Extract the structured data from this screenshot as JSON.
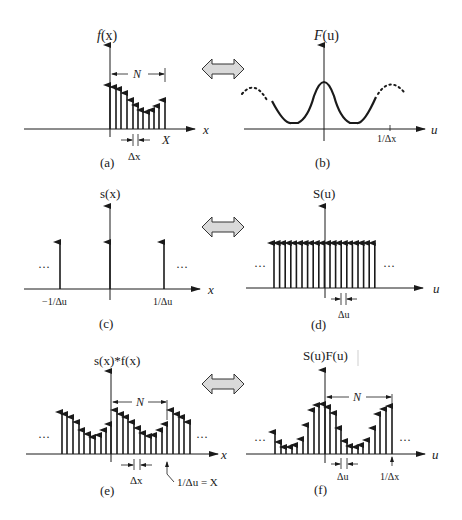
{
  "figure": {
    "panels": [
      {
        "id": "a",
        "caption": "(a)",
        "ylabel": "f(x)",
        "xlabel": "x",
        "annotations": [
          "N",
          "X",
          "Δx"
        ]
      },
      {
        "id": "b",
        "caption": "(b)",
        "ylabel": "F(u)",
        "xlabel": "u",
        "annotations": [
          "1/Δx"
        ]
      },
      {
        "id": "c",
        "caption": "(c)",
        "ylabel": "s(x)",
        "xlabel": "x",
        "annotations": [
          "−1/Δu",
          "1/Δu",
          "···",
          "···"
        ]
      },
      {
        "id": "d",
        "caption": "(d)",
        "ylabel": "S(u)",
        "xlabel": "u",
        "annotations": [
          "Δu",
          "···",
          "···"
        ]
      },
      {
        "id": "e",
        "caption": "(e)",
        "ylabel": "s(x)*f(x)",
        "xlabel": "x",
        "annotations": [
          "N",
          "Δx",
          "1/Δu = X",
          "···",
          "···"
        ]
      },
      {
        "id": "f",
        "caption": "(f)",
        "ylabel": "S(u)F(u)",
        "xlabel": "u",
        "annotations": [
          "N",
          "Δu",
          "1/Δx",
          "···",
          "···"
        ]
      }
    ],
    "transform_arrows": 3,
    "colors": {
      "ink": "#1a1a1a",
      "arrow_fill": "#d9d9d9"
    }
  },
  "labels": {
    "a": {
      "caption": "(a)",
      "ylabel_f": "f",
      "ylabel_rest": "(x)",
      "x": "x",
      "N": "N",
      "X": "X",
      "dx": "Δx"
    },
    "b": {
      "caption": "(b)",
      "ylabel_F": "F",
      "ylabel_rest": "(u)",
      "u": "u",
      "tick": "1/Δx"
    },
    "c": {
      "caption": "(c)",
      "ylabel": "s(x)",
      "x": "x",
      "left_tick": "−1/Δu",
      "right_tick": "1/Δu",
      "ellipsis": "···"
    },
    "d": {
      "caption": "(d)",
      "ylabel": "S(u)",
      "u": "u",
      "du": "Δu",
      "ellipsis": "···"
    },
    "e": {
      "caption": "(e)",
      "ylabel": "s(x)*f(x)",
      "x": "x",
      "N": "N",
      "dx": "Δx",
      "period": "1/Δu = X",
      "ellipsis": "···"
    },
    "f": {
      "caption": "(f)",
      "ylabel": "S(u)F(u)",
      "u": "u",
      "N": "N",
      "du": "Δu",
      "tick": "1/Δx",
      "ellipsis": "···"
    }
  }
}
